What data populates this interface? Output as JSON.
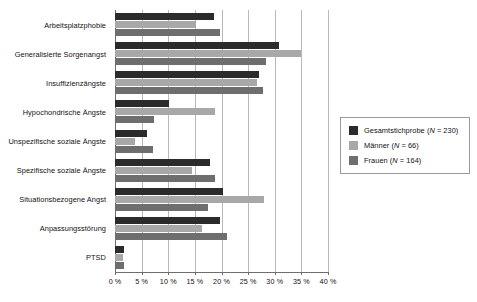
{
  "chart_data": {
    "type": "bar",
    "orientation": "horizontal",
    "title": "",
    "subtitle": "",
    "xlabel": "",
    "ylabel": "",
    "xlim": [
      0,
      40
    ],
    "xtick_labels": [
      "0 %",
      "5 %",
      "10 %",
      "15 %",
      "20 %",
      "25 %",
      "30 %",
      "35 %",
      "40 %"
    ],
    "xticks": [
      0,
      5,
      10,
      15,
      20,
      25,
      30,
      35,
      40
    ],
    "grid": true,
    "grid_axis": "x",
    "legend_position": "right",
    "categories": [
      "Arbeitsplatzphobie",
      "Generalisierte Sorgenangst",
      "Insuffizienzängste",
      "Hypochondrische Ängste",
      "Unspezifische soziale Ängste",
      "Spezifische soziale Ängste",
      "Situationsbezogene Angst",
      "Anpassungsstörung",
      "PTSD"
    ],
    "series": [
      {
        "name": "Gesamtstichprobe (N = 230)",
        "color": "#2b2b2b",
        "values": [
          18.5,
          30.8,
          27.0,
          10.2,
          6.0,
          17.8,
          20.2,
          19.8,
          1.6
        ]
      },
      {
        "name": "Männer (N = 66)",
        "color": "#a8a8a8",
        "values": [
          15.2,
          35.0,
          26.6,
          18.7,
          3.7,
          14.5,
          27.9,
          16.3,
          1.5
        ]
      },
      {
        "name": "Frauen (N = 164)",
        "color": "#6e6e6e",
        "values": [
          19.7,
          28.3,
          27.7,
          7.4,
          7.2,
          18.7,
          17.5,
          21.0,
          1.7
        ]
      }
    ]
  },
  "legend": {
    "items": [
      {
        "label": "Gesamtstichprobe (N = 230)",
        "name_part": "Gesamtstichprobe (",
        "italic_part": "N",
        "tail_part": " = 230)",
        "color": "#2b2b2b"
      },
      {
        "label": "Männer (N = 66)",
        "name_part": "Männer (",
        "italic_part": "N",
        "tail_part": " = 66)",
        "color": "#a8a8a8"
      },
      {
        "label": "Frauen (N = 164)",
        "name_part": "Frauen (",
        "italic_part": "N",
        "tail_part": " = 164)",
        "color": "#6e6e6e"
      }
    ]
  },
  "colors": {
    "series_total": "#2b2b2b",
    "series_men": "#a8a8a8",
    "series_women": "#6e6e6e",
    "gridline": "#b9b9b9",
    "axis": "#6e6e6e",
    "background": "#ffffff"
  }
}
